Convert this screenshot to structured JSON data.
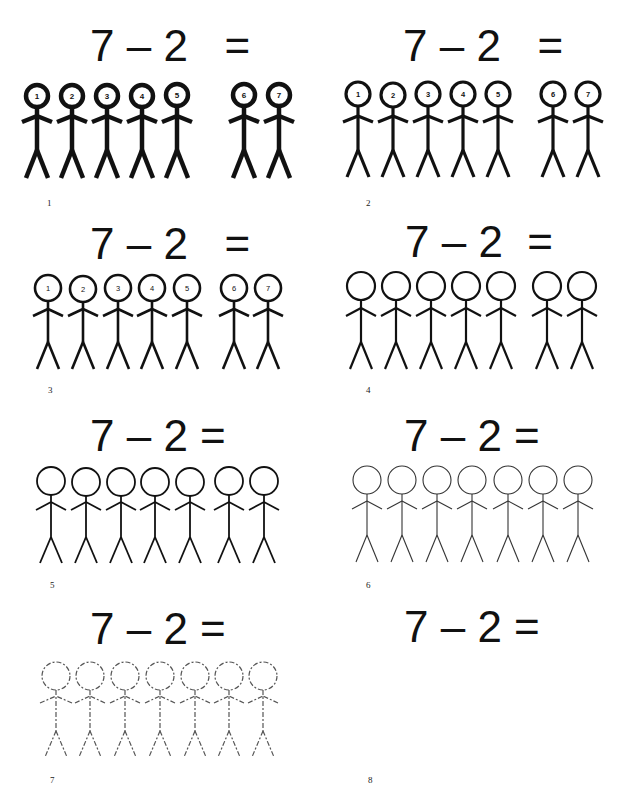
{
  "worksheet": {
    "equation_spaced": "7 – 2  =",
    "equation_tight": "7 – 2 =",
    "figure_count": 7,
    "group_split": [
      5,
      2
    ]
  },
  "panels": [
    {
      "number": "1",
      "equation": "7 – 2   =",
      "style": "bold-numbered",
      "figure_labels": [
        "1",
        "2",
        "3",
        "4",
        "5",
        "6",
        "7"
      ]
    },
    {
      "number": "2",
      "equation": "7 – 2   =",
      "style": "medium-numbered",
      "figure_labels": [
        "1",
        "2",
        "3",
        "4",
        "5",
        "6",
        "7"
      ]
    },
    {
      "number": "3",
      "equation": "7 – 2   =",
      "style": "thin-numbered",
      "figure_labels": [
        "1",
        "2",
        "3",
        "4",
        "5",
        "6",
        "7"
      ]
    },
    {
      "number": "4",
      "equation": "7 – 2  =",
      "style": "thin-unnumbered",
      "figure_labels": []
    },
    {
      "number": "5",
      "equation": "7 – 2 =",
      "style": "thinner-evenly-spaced",
      "figure_labels": []
    },
    {
      "number": "6",
      "equation": "7 – 2 =",
      "style": "hairline-evenly-spaced",
      "figure_labels": []
    },
    {
      "number": "7",
      "equation": "7 – 2 =",
      "style": "dashed-faded",
      "figure_labels": []
    },
    {
      "number": "8",
      "equation": "7 – 2 =",
      "style": "no-figures",
      "figure_labels": []
    }
  ],
  "colors": {
    "ink": "#111111",
    "faded": "#555555",
    "background": "#ffffff"
  }
}
